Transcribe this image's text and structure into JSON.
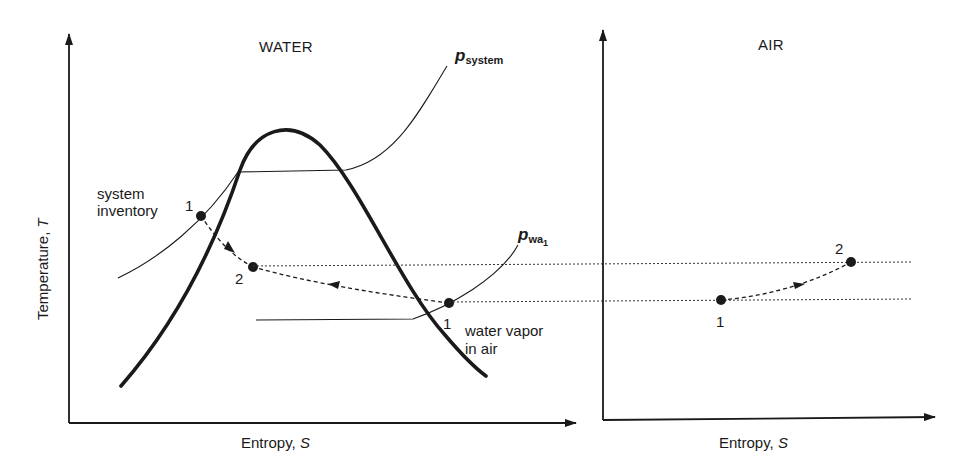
{
  "panels": {
    "water": {
      "title": "WATER",
      "x_axis_label": "Entropy, ",
      "x_axis_symbol": "S",
      "y_axis_label": "Temperature, ",
      "y_axis_symbol": "T",
      "curves": {
        "p_system": {
          "symbol": "p",
          "subscript": "system"
        },
        "p_wa1": {
          "symbol": "p",
          "subscript": "wa",
          "subsubscript": "1"
        }
      },
      "annotations": {
        "system_inventory_line1": "system",
        "system_inventory_line2": "inventory",
        "water_vapor_line1": "water vapor",
        "water_vapor_line2": "in air"
      },
      "points": [
        {
          "label": "1",
          "role": "system inventory state"
        },
        {
          "label": "2",
          "role": "system final state"
        },
        {
          "label": "1",
          "role": "water vapor in air state"
        }
      ]
    },
    "air": {
      "title": "AIR",
      "x_axis_label": "Entropy, ",
      "x_axis_symbol": "S",
      "points": [
        {
          "label": "1"
        },
        {
          "label": "2"
        }
      ]
    }
  },
  "colors": {
    "ink": "#1a1a1a",
    "background": "#ffffff"
  }
}
